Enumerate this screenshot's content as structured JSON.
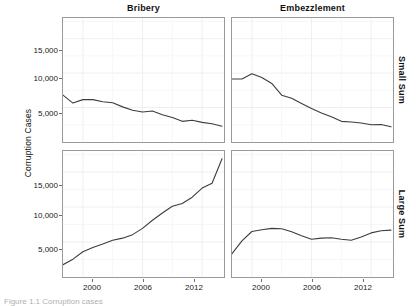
{
  "figure": {
    "ylabel": "Corruption Cases",
    "caption": "Figure 1.1  Corruption cases"
  },
  "axes": {
    "y_ticks": [
      "5,000",
      "10,000",
      "15,000"
    ],
    "y_tick_values": [
      5000,
      10000,
      15000
    ],
    "x_ticks": [
      "2000",
      "2006",
      "2012"
    ],
    "x_tick_values": [
      2000,
      2006,
      2012
    ]
  },
  "strips": {
    "columns": [
      "Bribery",
      "Embezzlement"
    ],
    "rows": [
      "Small Sum",
      "Large Sum"
    ]
  },
  "style": {
    "line_color": "#3d3d3d",
    "panel_border": "#9a9a9a",
    "grid_color": "#efefef",
    "background": "#ffffff"
  },
  "chart_data": {
    "type": "line",
    "title": "",
    "subtitle": "",
    "xlabel": "",
    "ylabel": "Corruption Cases",
    "xlim": [
      1998,
      2014.2
    ],
    "ylim": [
      0,
      18000
    ],
    "grid": true,
    "legend": "none",
    "facet_columns": [
      "Bribery",
      "Embezzlement"
    ],
    "facet_rows": [
      "Small Sum",
      "Large Sum"
    ],
    "x": [
      1998,
      1999,
      2000,
      2001,
      2002,
      2003,
      2004,
      2005,
      2006,
      2007,
      2008,
      2009,
      2010,
      2011,
      2012,
      2013,
      2014
    ],
    "panels": [
      {
        "row": "Small Sum",
        "column": "Bribery",
        "series": [
          {
            "name": "Bribery / Small Sum",
            "values": [
              6800,
              5650,
              6150,
              6150,
              5850,
              5700,
              5100,
              4600,
              4350,
              4500,
              3950,
              3550,
              3000,
              3150,
              2850,
              2650,
              2300
            ]
          }
        ]
      },
      {
        "row": "Small Sum",
        "column": "Embezzlement",
        "series": [
          {
            "name": "Embezzlement / Small Sum",
            "values": [
              9150,
              9150,
              9900,
              9350,
              8500,
              6800,
              6350,
              5600,
              4850,
              4200,
              3650,
              3000,
              2900,
              2750,
              2500,
              2550,
              2200
            ]
          }
        ]
      },
      {
        "row": "Large Sum",
        "column": "Bribery",
        "series": [
          {
            "name": "Bribery / Large Sum",
            "values": [
              1750,
              2550,
              3600,
              4200,
              4700,
              5250,
              5550,
              6050,
              6950,
              8100,
              9150,
              10100,
              10500,
              11400,
              12700,
              13400,
              16900
            ]
          }
        ]
      },
      {
        "row": "Large Sum",
        "column": "Embezzlement",
        "series": [
          {
            "name": "Embezzlement / Large Sum",
            "values": [
              3350,
              5150,
              6500,
              6750,
              6950,
              6900,
              6450,
              5900,
              5400,
              5550,
              5600,
              5400,
              5250,
              5700,
              6300,
              6600,
              6700
            ]
          }
        ]
      }
    ]
  }
}
